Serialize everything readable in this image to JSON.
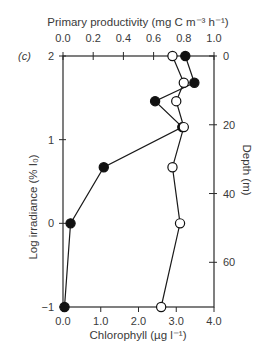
{
  "chart_data": {
    "type": "line",
    "panel_label": "(c)",
    "title": "",
    "top_axis": {
      "label": "Primary productivity (mg C m⁻³ h⁻¹)",
      "ticks": [
        0.0,
        0.2,
        0.4,
        0.6,
        0.8,
        1.0
      ],
      "tick_labels": [
        "0.0",
        "0.2",
        "0.4",
        "0.6",
        "0.8",
        "1.0"
      ],
      "range": [
        0.0,
        1.0
      ]
    },
    "bottom_axis": {
      "label": "Chlorophyll (µg l⁻¹)",
      "ticks": [
        0.0,
        1.0,
        2.0,
        3.0,
        4.0
      ],
      "tick_labels": [
        "0.0",
        "1.0",
        "2.0",
        "3.0",
        "4.0"
      ],
      "range": [
        0.0,
        4.0
      ]
    },
    "left_axis": {
      "label": "Log irradiance (% I₀)",
      "ticks": [
        2,
        1,
        0,
        -1
      ],
      "tick_labels": [
        "2",
        "1",
        "0",
        "−1"
      ],
      "range": [
        -1,
        2
      ]
    },
    "right_axis": {
      "label": "Depth (m)",
      "ticks": [
        0,
        20,
        40,
        60
      ],
      "tick_labels": [
        "0",
        "20",
        "40",
        "60"
      ],
      "range": [
        0,
        73
      ]
    },
    "grid": false,
    "legend": null,
    "series": [
      {
        "name": "Primary productivity",
        "marker": "filled-circle",
        "x_axis": "top",
        "points": [
          {
            "x": 0.81,
            "log_irradiance": 2.0
          },
          {
            "x": 0.87,
            "log_irradiance": 1.68
          },
          {
            "x": 0.61,
            "log_irradiance": 1.46
          },
          {
            "x": 0.79,
            "log_irradiance": 1.15
          },
          {
            "x": 0.27,
            "log_irradiance": 0.67
          },
          {
            "x": 0.05,
            "log_irradiance": 0.0
          },
          {
            "x": 0.01,
            "log_irradiance": -1.0
          }
        ]
      },
      {
        "name": "Chlorophyll",
        "marker": "open-circle",
        "x_axis": "bottom",
        "points": [
          {
            "x": 2.9,
            "log_irradiance": 2.0
          },
          {
            "x": 3.2,
            "log_irradiance": 1.68
          },
          {
            "x": 3.0,
            "log_irradiance": 1.46
          },
          {
            "x": 3.2,
            "log_irradiance": 1.15
          },
          {
            "x": 2.9,
            "log_irradiance": 0.67
          },
          {
            "x": 3.1,
            "log_irradiance": 0.0
          },
          {
            "x": 2.6,
            "log_irradiance": -1.0
          }
        ]
      }
    ]
  }
}
